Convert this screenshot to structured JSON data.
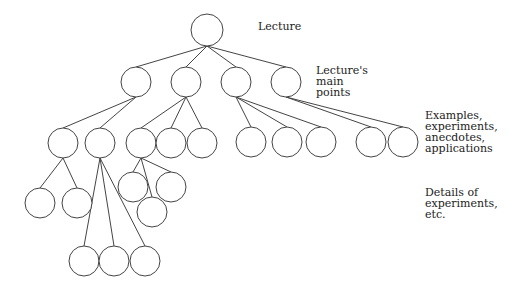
{
  "diagram": {
    "type": "tree",
    "stroke_color": "#444444",
    "node_radius": 15,
    "nodes": [
      {
        "id": "root",
        "x": 207,
        "y": 30,
        "r": 16
      },
      {
        "id": "m1",
        "x": 136,
        "y": 82
      },
      {
        "id": "m2",
        "x": 186,
        "y": 82
      },
      {
        "id": "m3",
        "x": 236,
        "y": 82
      },
      {
        "id": "m4",
        "x": 286,
        "y": 82
      },
      {
        "id": "e1",
        "x": 63,
        "y": 143
      },
      {
        "id": "e2",
        "x": 100,
        "y": 143
      },
      {
        "id": "e3",
        "x": 141,
        "y": 143
      },
      {
        "id": "e4",
        "x": 171,
        "y": 143
      },
      {
        "id": "e5",
        "x": 202,
        "y": 143
      },
      {
        "id": "e6",
        "x": 251,
        "y": 142
      },
      {
        "id": "e7",
        "x": 287,
        "y": 142
      },
      {
        "id": "e8",
        "x": 321,
        "y": 142
      },
      {
        "id": "e9",
        "x": 371,
        "y": 142
      },
      {
        "id": "e10",
        "x": 403,
        "y": 142
      },
      {
        "id": "d1",
        "x": 40,
        "y": 203
      },
      {
        "id": "d2",
        "x": 77,
        "y": 203
      },
      {
        "id": "d3",
        "x": 133,
        "y": 187
      },
      {
        "id": "d4",
        "x": 171,
        "y": 187
      },
      {
        "id": "d5",
        "x": 152,
        "y": 212
      },
      {
        "id": "d6",
        "x": 84,
        "y": 261
      },
      {
        "id": "d7",
        "x": 114,
        "y": 261
      },
      {
        "id": "d8",
        "x": 145,
        "y": 261
      }
    ],
    "edges": [
      [
        "root",
        "m1"
      ],
      [
        "root",
        "m2"
      ],
      [
        "root",
        "m3"
      ],
      [
        "root",
        "m4"
      ],
      [
        "m1",
        "e1"
      ],
      [
        "m1",
        "e2"
      ],
      [
        "m2",
        "e3"
      ],
      [
        "m2",
        "e4"
      ],
      [
        "m2",
        "e5"
      ],
      [
        "m3",
        "e6"
      ],
      [
        "m3",
        "e7"
      ],
      [
        "m3",
        "e8"
      ],
      [
        "m4",
        "e9"
      ],
      [
        "m4",
        "e10"
      ],
      [
        "e1",
        "d1"
      ],
      [
        "e1",
        "d2"
      ],
      [
        "e3",
        "d3"
      ],
      [
        "e3",
        "d4"
      ],
      [
        "e3",
        "d5"
      ],
      [
        "e2",
        "d6"
      ],
      [
        "e2",
        "d7"
      ],
      [
        "e2",
        "d8"
      ]
    ]
  },
  "labels": {
    "lecture": "Lecture",
    "main_points": "Lecture's\nmain\npoints",
    "examples": "Examples,\nexperiments,\nanecdotes,\napplications",
    "details": "Details of\nexperiments,\netc."
  }
}
